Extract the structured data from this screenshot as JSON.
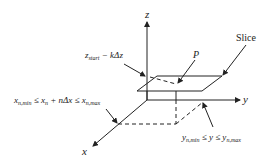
{
  "diagram": {
    "type": "3d-coordinate-slice",
    "axes": {
      "x_label": "x",
      "y_label": "y",
      "z_label": "z"
    },
    "labels": {
      "slice": "Slice",
      "point": "P",
      "z_constraint": {
        "base": "z",
        "sub": "start",
        "rest": " − kΔz"
      },
      "x_constraint": {
        "p1": "x",
        "p1_sub": "n,min",
        "p2": " ≤ x",
        "p2_sub": "n",
        "p3": " + nΔx ≤ x",
        "p3_sub": "n,max"
      },
      "y_constraint": {
        "p1": "y",
        "p1_sub": "n,min",
        "p2": " ≤ y ≤ y",
        "p2_sub": "n,max"
      }
    },
    "colors": {
      "line": "#222222",
      "background": "#ffffff"
    }
  }
}
